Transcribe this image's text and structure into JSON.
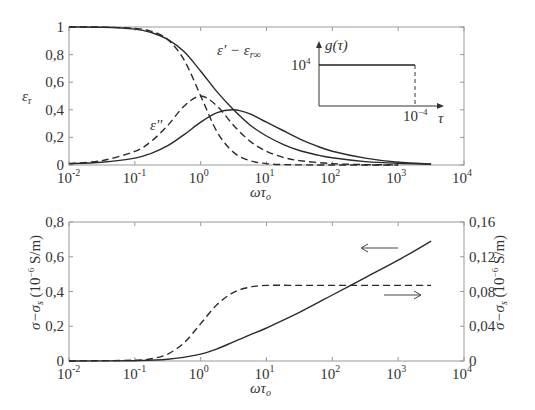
{
  "chart_data": [
    {
      "type": "line",
      "title": "",
      "xlabel": "ωτ₀",
      "ylabel": "εr",
      "xscale": "log",
      "xlim": [
        0.01,
        10000
      ],
      "ylim": [
        0,
        1
      ],
      "x_ticks": [
        {
          "base": "10",
          "exp": "-2",
          "value": -2
        },
        {
          "base": "10",
          "exp": "-1",
          "value": -1
        },
        {
          "base": "10",
          "exp": "0",
          "value": 0
        },
        {
          "base": "10",
          "exp": "1",
          "value": 1
        },
        {
          "base": "10",
          "exp": "2",
          "value": 2
        },
        {
          "base": "10",
          "exp": "3",
          "value": 3
        },
        {
          "base": "10",
          "exp": "4",
          "value": 4
        }
      ],
      "y_ticks": [
        "0",
        "0,2",
        "0,4",
        "0,6",
        "0,8",
        "1"
      ],
      "y_tick_values": [
        0,
        0.2,
        0.4,
        0.6,
        0.8,
        1
      ],
      "annotations": {
        "eps_prime": "ε' − εr∞",
        "eps_double_prime": "ε''"
      },
      "series": [
        {
          "name": "ε' − εr∞ (Debye)",
          "style": "dashed",
          "x_log": [
            -2,
            -1.5,
            -1,
            -0.75,
            -0.5,
            -0.25,
            0,
            0.25,
            0.5,
            0.75,
            1,
            1.25,
            1.5,
            2,
            2.5,
            3
          ],
          "values": [
            1.0,
            0.999,
            0.99,
            0.969,
            0.909,
            0.76,
            0.5,
            0.24,
            0.091,
            0.031,
            0.01,
            0.003,
            0.001,
            0.0,
            0.0,
            0.0
          ]
        },
        {
          "name": "ε'' (Debye)",
          "style": "dashed",
          "x_log": [
            -2,
            -1.5,
            -1,
            -0.75,
            -0.5,
            -0.25,
            0,
            0.25,
            0.5,
            0.75,
            1,
            1.25,
            1.5,
            2,
            2.5,
            3
          ],
          "values": [
            0.01,
            0.032,
            0.099,
            0.172,
            0.287,
            0.427,
            0.5,
            0.427,
            0.287,
            0.172,
            0.099,
            0.056,
            0.032,
            0.01,
            0.003,
            0.001
          ]
        },
        {
          "name": "ε' − εr∞ (distribution)",
          "style": "solid",
          "x_log": [
            -2,
            -1.5,
            -1,
            -0.75,
            -0.5,
            -0.25,
            0,
            0.25,
            0.5,
            0.75,
            1,
            1.25,
            1.5,
            1.75,
            2,
            2.5,
            3,
            3.5
          ],
          "values": [
            1.0,
            0.998,
            0.985,
            0.96,
            0.91,
            0.82,
            0.68,
            0.53,
            0.4,
            0.29,
            0.21,
            0.15,
            0.105,
            0.075,
            0.052,
            0.025,
            0.012,
            0.005
          ]
        },
        {
          "name": "ε'' (distribution)",
          "style": "solid",
          "x_log": [
            -2,
            -1.5,
            -1,
            -0.75,
            -0.5,
            -0.25,
            0,
            0.25,
            0.5,
            0.75,
            1,
            1.25,
            1.5,
            1.75,
            2,
            2.5,
            3,
            3.5
          ],
          "values": [
            0.01,
            0.02,
            0.05,
            0.085,
            0.14,
            0.22,
            0.31,
            0.38,
            0.4,
            0.37,
            0.31,
            0.25,
            0.19,
            0.14,
            0.1,
            0.05,
            0.02,
            0.008
          ]
        }
      ],
      "inset": {
        "ylabel": "g(τ)",
        "xlabel": "τ",
        "y_tick": "10⁴",
        "x_tick": "10⁻⁴",
        "shape": "rectangular distribution: g(τ)=10⁴ for 0<τ<10⁻⁴"
      }
    },
    {
      "type": "line",
      "title": "",
      "xlabel": "ωτ₀",
      "ylabel_left": "σ−σs (10⁻⁶ S/m)",
      "ylabel_right": "σ−σs (10⁻⁶ S/m)",
      "xscale": "log",
      "xlim": [
        0.01,
        10000
      ],
      "ylim_left": [
        0,
        0.8
      ],
      "ylim_right": [
        0,
        0.16
      ],
      "x_ticks": [
        {
          "base": "10",
          "exp": "-2",
          "value": -2
        },
        {
          "base": "10",
          "exp": "-1",
          "value": -1
        },
        {
          "base": "10",
          "exp": "0",
          "value": 0
        },
        {
          "base": "10",
          "exp": "1",
          "value": 1
        },
        {
          "base": "10",
          "exp": "2",
          "value": 2
        },
        {
          "base": "10",
          "exp": "3",
          "value": 3
        },
        {
          "base": "10",
          "exp": "4",
          "value": 4
        }
      ],
      "y_ticks_left": [
        "0",
        "0,2",
        "0,4",
        "0,6",
        "0,8"
      ],
      "y_tick_values_left": [
        0,
        0.2,
        0.4,
        0.6,
        0.8
      ],
      "y_ticks_right": [
        "0",
        "0,04",
        "0,08",
        "0,12",
        "0,16"
      ],
      "y_tick_values_right": [
        0,
        0.04,
        0.08,
        0.12,
        0.16
      ],
      "series": [
        {
          "name": "distribution (left axis)",
          "style": "solid",
          "axis": "left",
          "x_log": [
            -2,
            -1,
            -0.5,
            0,
            0.25,
            0.5,
            0.75,
            1,
            1.5,
            2,
            2.5,
            3,
            3.5
          ],
          "values": [
            0.0,
            0.002,
            0.01,
            0.04,
            0.07,
            0.11,
            0.15,
            0.19,
            0.28,
            0.38,
            0.48,
            0.58,
            0.69
          ]
        },
        {
          "name": "Debye (right axis)",
          "style": "dashed",
          "axis": "right",
          "x_log": [
            -2,
            -1,
            -0.75,
            -0.5,
            -0.25,
            0,
            0.25,
            0.5,
            0.75,
            1,
            1.5,
            2,
            2.5,
            3,
            3.5
          ],
          "values": [
            0.0,
            0.0009,
            0.0027,
            0.008,
            0.021,
            0.043,
            0.065,
            0.079,
            0.085,
            0.087,
            0.087,
            0.087,
            0.087,
            0.087,
            0.087
          ]
        }
      ],
      "arrows": [
        {
          "direction": "left",
          "refers_to": "left axis"
        },
        {
          "direction": "right",
          "refers_to": "right axis"
        }
      ]
    }
  ]
}
